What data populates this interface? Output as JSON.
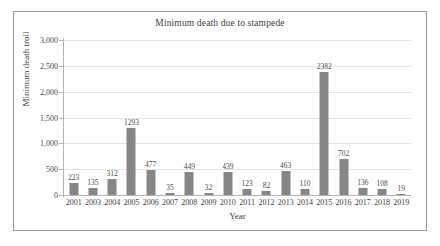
{
  "chart_data": {
    "type": "bar",
    "title": "Minimum death due to stampede",
    "xlabel": "Year",
    "ylabel": "Minimum death troll",
    "categories": [
      "2001",
      "2003",
      "2004",
      "2005",
      "2006",
      "2007",
      "2008",
      "2009",
      "2010",
      "2011",
      "2012",
      "2013",
      "2014",
      "2015",
      "2016",
      "2017",
      "2018",
      "2019"
    ],
    "values": [
      223,
      135,
      312,
      1293,
      477,
      35,
      449,
      32,
      439,
      123,
      82,
      463,
      110,
      2382,
      702,
      136,
      108,
      19
    ],
    "value_labels": [
      "223",
      "135",
      "312",
      "1293",
      "477",
      "35",
      "449",
      "32",
      "439",
      "123",
      "82",
      "463",
      "110",
      "2382",
      "702",
      "136",
      "108",
      "19"
    ],
    "ylim": [
      0,
      3000
    ],
    "ytick_values": [
      0,
      500,
      1000,
      1500,
      2000,
      2500,
      3000
    ],
    "ytick_labels": [
      "0",
      "500",
      "1,000",
      "1,500",
      "2,000",
      "2,500",
      "3,000"
    ],
    "grid": true,
    "legend": false,
    "bar_color": "#868686",
    "gridline_color": "#e3e3e3",
    "axis_color": "#b4b4b4",
    "frame_color": "#9a9a9a"
  }
}
